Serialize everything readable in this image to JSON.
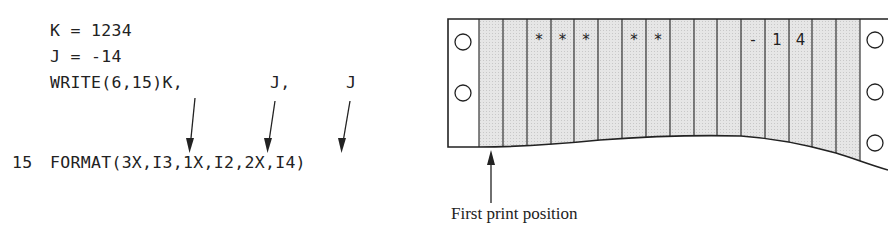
{
  "code": {
    "lines": [
      "K = 1234",
      "J = -14",
      "WRITE(6,15)K,"
    ],
    "write_args": [
      "J,",
      "J"
    ],
    "format_label": "15",
    "format_statement": "FORMAT(3X,I3,1X,I2,2X,I4)"
  },
  "printout": {
    "column_count": 16,
    "columns": [
      "",
      "",
      "*",
      "*",
      "*",
      "",
      "*",
      "*",
      "",
      "",
      "",
      "-",
      "1",
      "4",
      "",
      ""
    ],
    "left_holes": 2,
    "right_holes": 3,
    "paper_shade": "#e4e4e4",
    "line_color": "#222222"
  },
  "caption": "First print position"
}
